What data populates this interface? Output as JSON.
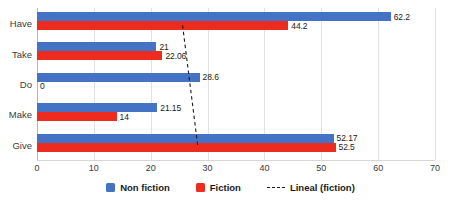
{
  "chart_data": {
    "type": "bar",
    "orientation": "horizontal",
    "title": "",
    "subtitle": "",
    "xlabel": "",
    "ylabel": "",
    "xlim": [
      0,
      70
    ],
    "xticks": [
      0,
      10,
      20,
      30,
      40,
      50,
      60,
      70
    ],
    "xtick_labels": [
      "0",
      "10",
      "20",
      "30",
      "40",
      "50",
      "60",
      "70"
    ],
    "grid": true,
    "grid_axis": "x",
    "legend_position": "bottom",
    "categories": [
      "Have",
      "Take",
      "Do",
      "Make",
      "Give"
    ],
    "series": [
      {
        "name": "Non fiction",
        "color": "#4472C4",
        "values": [
          62.2,
          21,
          28.6,
          21.15,
          52.17
        ],
        "labels": [
          "62.2",
          "21",
          "28.6",
          "21.15",
          "52.17"
        ]
      },
      {
        "name": "Fiction",
        "color": "#ED2B1F",
        "values": [
          44.2,
          22.06,
          0,
          14,
          52.5
        ],
        "labels": [
          "44.2",
          "22.06",
          "0",
          "14",
          "52.5"
        ]
      }
    ],
    "trendline": {
      "name": "Lineal (fiction)",
      "style": "dashed",
      "color": "#1A1A1A",
      "x_start": 25.6,
      "y_start_category": "Have",
      "x_end": 28.3,
      "y_end_category": "Give"
    },
    "legend": [
      {
        "label": "Non fiction",
        "marker": "square",
        "color": "#4472C4"
      },
      {
        "label": "Fiction",
        "marker": "square",
        "color": "#ED2B1F"
      },
      {
        "label": "Lineal (fiction)",
        "marker": "dashed-line",
        "color": "#1A1A1A"
      }
    ]
  }
}
